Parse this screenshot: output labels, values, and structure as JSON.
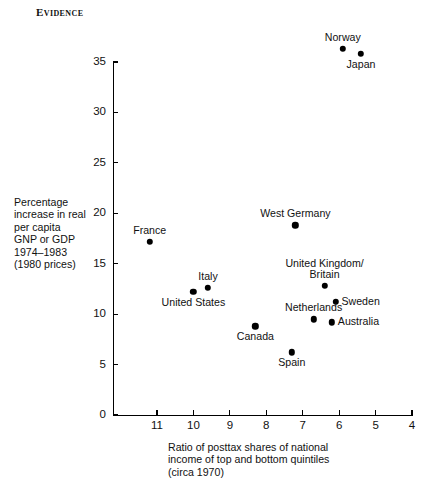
{
  "figure": {
    "header": "Evidence"
  },
  "chart_data": {
    "type": "scatter",
    "title": "Evidence",
    "xlabel": "Ratio of posttax shares of national income of top and bottom quintiles (circa 1970)",
    "xlabel_lines": [
      "Ratio of posttax shares of national",
      "income of top and bottom quintiles",
      "(circa 1970)"
    ],
    "ylabel": "Percentage increase in real per capita GNP or GDP 1974–1983 (1980 prices)",
    "ylabel_lines": [
      "Percentage",
      "increase in real",
      "per capita",
      "GNP or GDP",
      "1974–1983",
      "(1980 prices)"
    ],
    "xlim": [
      11.5,
      4.0
    ],
    "ylim": [
      0,
      35
    ],
    "x_reversed": true,
    "xticks": [
      11,
      10,
      9,
      8,
      7,
      6,
      5,
      4
    ],
    "yticks": [
      0,
      5,
      10,
      15,
      20,
      25,
      30,
      35
    ],
    "grid": false,
    "legend": "none",
    "marker_color": "#000000",
    "points": [
      {
        "name": "Norway",
        "x": 5.9,
        "y": 36.3,
        "label_pos": "above"
      },
      {
        "name": "Japan",
        "x": 5.4,
        "y": 35.8,
        "label_pos": "below"
      },
      {
        "name": "West Germany",
        "x": 7.2,
        "y": 18.8,
        "label_pos": "above"
      },
      {
        "name": "France",
        "x": 11.2,
        "y": 17.2,
        "label_pos": "above"
      },
      {
        "name": "United Kingdom/\nBritain",
        "x": 6.4,
        "y": 12.8,
        "label_pos": "above2"
      },
      {
        "name": "Italy",
        "x": 9.6,
        "y": 12.6,
        "label_pos": "above"
      },
      {
        "name": "United States",
        "x": 10.0,
        "y": 12.2,
        "label_pos": "below"
      },
      {
        "name": "Sweden",
        "x": 6.1,
        "y": 11.2,
        "label_pos": "right"
      },
      {
        "name": "Netherlands",
        "x": 6.7,
        "y": 9.5,
        "label_pos": "above"
      },
      {
        "name": "Australia",
        "x": 6.2,
        "y": 9.2,
        "label_pos": "right"
      },
      {
        "name": "Canada",
        "x": 8.3,
        "y": 8.8,
        "label_pos": "below"
      },
      {
        "name": "Spain",
        "x": 7.3,
        "y": 6.2,
        "label_pos": "below"
      }
    ]
  }
}
